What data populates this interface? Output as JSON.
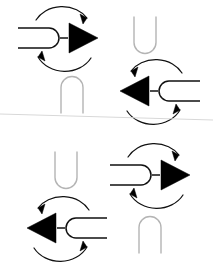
{
  "canvas": {
    "width": 213,
    "height": 272,
    "background": "#ffffff"
  },
  "palette": {
    "dark_stroke": "#111111",
    "dark_fill": "#000000",
    "light_stroke": "#b4b4b4",
    "faint_line": "#d8d8d8"
  },
  "figure": {
    "type": "line-diagram",
    "divider": {
      "name": "horizon-line",
      "x1": 0,
      "y1": 114,
      "x2": 213,
      "y2": 120,
      "stroke": "#d8d8d8",
      "stroke_width": 1
    },
    "elements": [
      {
        "id": "rotation-symbol-top-left",
        "kind": "rotation-symbol",
        "orientation": "right",
        "center_x": 63,
        "center_y": 38,
        "scale": 1.0,
        "stroke": "#111111",
        "fill": "#000000",
        "parts": [
          "u-connector",
          "dash",
          "triangle",
          "arc-arrow-top",
          "arc-arrow-bottom"
        ]
      },
      {
        "id": "u-shape-top-right",
        "kind": "u-outline",
        "orientation": "up",
        "center_x": 145,
        "center_y": 35,
        "width": 22,
        "height": 37,
        "stroke": "#b4b4b4",
        "stroke_width": 1.4
      },
      {
        "id": "u-shape-mid-left",
        "kind": "u-outline",
        "orientation": "down",
        "center_x": 72,
        "center_y": 95,
        "width": 22,
        "height": 37,
        "stroke": "#b4b4b4",
        "stroke_width": 1.4
      },
      {
        "id": "rotation-symbol-mid-right",
        "kind": "rotation-symbol",
        "orientation": "left",
        "center_x": 155,
        "center_y": 91,
        "scale": 1.0,
        "stroke": "#111111",
        "fill": "#000000",
        "parts": [
          "u-connector",
          "dash",
          "triangle",
          "arc-arrow-top",
          "arc-arrow-bottom"
        ]
      },
      {
        "id": "u-shape-bottom-left-upper",
        "kind": "u-outline",
        "orientation": "up",
        "center_x": 66,
        "center_y": 170,
        "width": 22,
        "height": 37,
        "stroke": "#b4b4b4",
        "stroke_width": 1.4
      },
      {
        "id": "rotation-symbol-bottom-right",
        "kind": "rotation-symbol",
        "orientation": "right",
        "center_x": 155,
        "center_y": 175,
        "scale": 1.0,
        "stroke": "#111111",
        "fill": "#000000",
        "parts": [
          "u-connector",
          "dash",
          "triangle",
          "arc-arrow-top",
          "arc-arrow-bottom"
        ]
      },
      {
        "id": "rotation-symbol-bottom-left",
        "kind": "rotation-symbol",
        "orientation": "left",
        "center_x": 62,
        "center_y": 228,
        "scale": 1.0,
        "stroke": "#111111",
        "fill": "#000000",
        "parts": [
          "u-connector",
          "dash",
          "triangle",
          "arc-arrow-top",
          "arc-arrow-bottom"
        ]
      },
      {
        "id": "u-shape-bottom-right-lower",
        "kind": "u-outline",
        "orientation": "down",
        "center_x": 150,
        "center_y": 235,
        "width": 22,
        "height": 37,
        "stroke": "#b4b4b4",
        "stroke_width": 1.4
      }
    ]
  }
}
